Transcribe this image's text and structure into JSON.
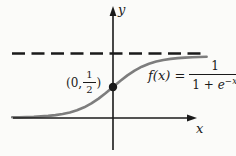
{
  "figure": {
    "colors": {
      "ink": "#1a1a1a",
      "curve": "#7d7d7d",
      "background": "#fbfbf9"
    },
    "labels": {
      "y_axis": "y",
      "x_axis": "x",
      "point_prefix": "(0,",
      "point_frac_top": "1",
      "point_frac_bottom": "2",
      "point_suffix": ")",
      "eq_lhs": "f(x) =",
      "eq_num": "1",
      "eq_den_prefix": "1 + ",
      "eq_den_e": "e",
      "eq_exp": "−x"
    }
  },
  "chart_data": {
    "type": "line",
    "title": "",
    "function_label": "f(x) = 1/(1 + e^(-x))",
    "xlabel": "x",
    "ylabel": "y",
    "xlim": [
      -5.6,
      5.8
    ],
    "ylim": [
      0,
      1.1
    ],
    "grid": false,
    "asymptotes": [
      {
        "y": 1,
        "style": "dashed"
      },
      {
        "y": 0,
        "style": "x-axis"
      }
    ],
    "marked_points": [
      {
        "x": 0,
        "y": 0.5,
        "label": "(0, 1/2)"
      }
    ],
    "x": [
      -5.6,
      -5.2,
      -4.8,
      -4.4,
      -4.0,
      -3.6,
      -3.2,
      -2.8,
      -2.4,
      -2.0,
      -1.6,
      -1.2,
      -0.8,
      -0.4,
      0,
      0.4,
      0.8,
      1.2,
      1.6,
      2.0,
      2.4,
      2.8,
      3.2,
      3.6,
      4.0,
      4.4,
      4.8,
      5.2
    ],
    "y": [
      0.0037,
      0.0055,
      0.0082,
      0.0121,
      0.018,
      0.0266,
      0.0392,
      0.0573,
      0.0832,
      0.1192,
      0.168,
      0.2315,
      0.31,
      0.4013,
      0.5,
      0.5987,
      0.69,
      0.7685,
      0.832,
      0.8808,
      0.9168,
      0.9427,
      0.9608,
      0.9734,
      0.982,
      0.9879,
      0.9918,
      0.9945
    ]
  }
}
